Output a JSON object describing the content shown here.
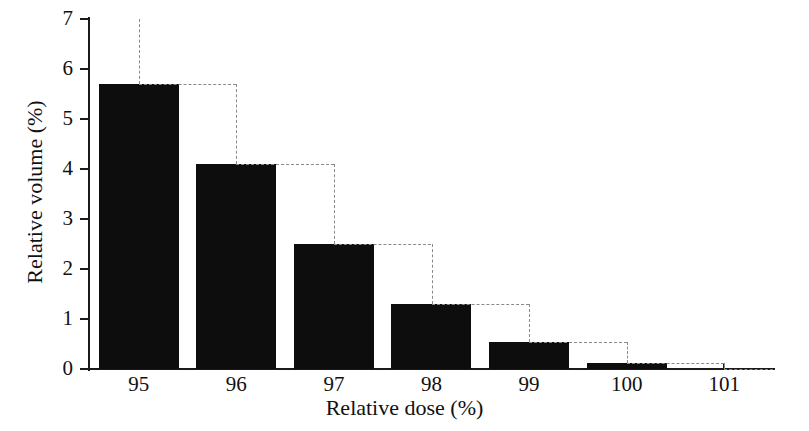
{
  "chart_data": {
    "type": "bar",
    "title": "",
    "xlabel": "Relative dose (%)",
    "ylabel": "Relative volume (%)",
    "categories": [
      "95",
      "96",
      "97",
      "98",
      "99",
      "100",
      "101"
    ],
    "values": [
      5.7,
      4.1,
      2.5,
      1.3,
      0.55,
      0.12,
      0.0
    ],
    "series": [
      {
        "name": "Differential volume",
        "style": "bar-filled-black",
        "values": [
          5.7,
          4.1,
          2.5,
          1.3,
          0.55,
          0.12,
          0.0
        ]
      },
      {
        "name": "Step outline",
        "style": "dashed-step-line",
        "values": [
          7.0,
          5.7,
          4.1,
          2.5,
          1.3,
          0.55,
          0.12
        ]
      }
    ],
    "xlim": [
      94.5,
      101.5
    ],
    "ylim": [
      0,
      7
    ],
    "yticks": [
      0,
      1,
      2,
      3,
      4,
      5,
      6,
      7
    ],
    "ytick_labels": [
      "0",
      "1",
      "2",
      "3",
      "4",
      "5",
      "6",
      "7"
    ],
    "xticks": [
      95,
      96,
      97,
      98,
      99,
      100,
      101
    ],
    "xtick_labels": [
      "95",
      "96",
      "97",
      "98",
      "99",
      "100",
      "101"
    ],
    "grid": false,
    "legend": "none",
    "colors": {
      "bar_fill": "#0d0d0d",
      "axis": "#1a1a1a",
      "dashed_line": "#8a8a8a",
      "background": "#ffffff"
    }
  }
}
